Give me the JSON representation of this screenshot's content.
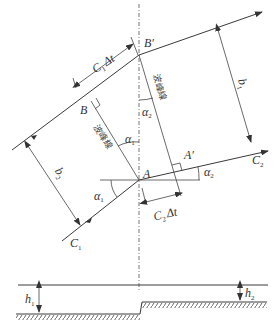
{
  "diagram": {
    "points": {
      "A": "A",
      "A_prime": "A′",
      "B": "B",
      "B_prime": "B′"
    },
    "rays": {
      "c1": "C",
      "c1_sub": "1",
      "c2": "C",
      "c2_sub": "2"
    },
    "angles": {
      "alpha1_a": "α",
      "alpha1_a_sub": "1",
      "alpha1_b": "α",
      "alpha1_b_sub": "1",
      "alpha2_a": "α",
      "alpha2_a_sub": "2",
      "alpha2_b": "α",
      "alpha2_b_sub": "2"
    },
    "dimensions": {
      "c1dt": "C",
      "c1dt_sub": "1",
      "c1dt_rest": "Δt",
      "c2dt": "C",
      "c2dt_sub": "2",
      "c2dt_rest": "Δt",
      "b1": "b",
      "b1_sub": "1",
      "b2": "b",
      "b2_sub": "2"
    },
    "wave_crest_labels": {
      "left": "波峰線",
      "right": "波峰線"
    },
    "depths": {
      "h1": "h",
      "h1_sub": "1",
      "h2": "h",
      "h2_sub": "2"
    },
    "colors": {
      "line": "#3a3a3a",
      "background": "#ffffff"
    }
  }
}
